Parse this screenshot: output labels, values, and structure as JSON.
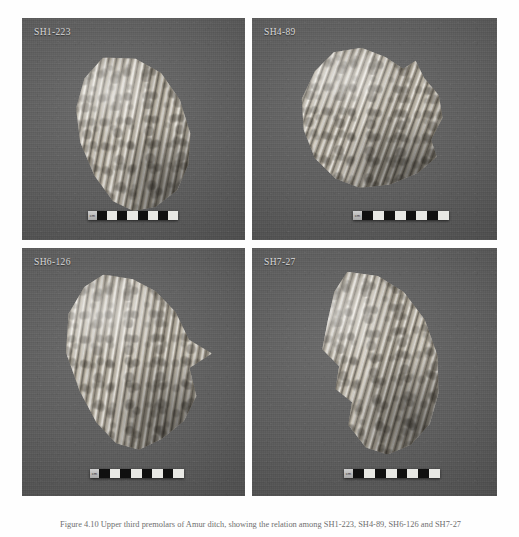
{
  "figure": {
    "caption": "Figure 4.10 Upper third premolars of Amur ditch, showing the relation among SH1-223, SH4-89, SH6-126 and SH7-27",
    "panel_count": 4,
    "background_color": "#5a5a5a",
    "page_color": "#ffffff",
    "specimen_color": "#cdc6b7",
    "label_color": "#d9d9d9"
  },
  "panels": [
    {
      "id": "panel-1",
      "label": "SH1-223",
      "position": "top-left",
      "specimen": {
        "name": "ridged-fossil-tooth",
        "description": "fossil molar crown with vertical enamel lamellae, oriented upper-left to lower-right"
      },
      "scale_bar": {
        "unit_label": "cm",
        "segments": 8,
        "first_segment": "dark"
      }
    },
    {
      "id": "panel-2",
      "label": "SH4-89",
      "position": "top-right",
      "specimen": {
        "name": "ridged-fossil-tooth",
        "description": "worn fossil molar fragment, broad triangular outline with serrated right margin"
      },
      "scale_bar": {
        "unit_label": "cm",
        "segments": 8,
        "first_segment": "dark"
      }
    },
    {
      "id": "panel-3",
      "label": "SH6-126",
      "position": "bottom-left",
      "specimen": {
        "name": "ridged-fossil-tooth",
        "description": "fossil molar with prominent enamel plates and a lateral projecting spur on the right"
      },
      "scale_bar": {
        "unit_label": "cm",
        "segments": 8,
        "first_segment": "dark"
      }
    },
    {
      "id": "panel-4",
      "label": "SH7-27",
      "position": "bottom-right",
      "specimen": {
        "name": "ridged-fossil-tooth",
        "description": "elongate fossil molar tilted diagonally, vertical lamellae with a vertical crack at upper left"
      },
      "scale_bar": {
        "unit_label": "cm",
        "segments": 8,
        "first_segment": "dark"
      }
    }
  ]
}
